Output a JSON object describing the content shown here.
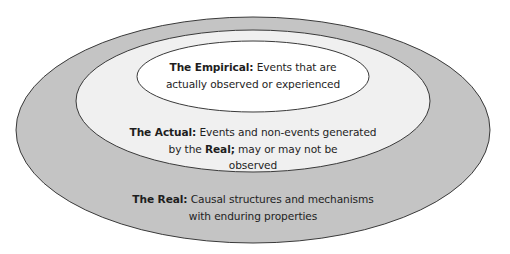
{
  "diagram": {
    "type": "nested-ellipses",
    "colors": {
      "real_fill": "#c4c4c4",
      "actual_fill": "#f0f0f0",
      "empirical_fill": "#ffffff",
      "stroke": "#3a3a3a",
      "text": "#1e1e1e"
    },
    "layers": [
      {
        "id": "real",
        "term": "The Real:",
        "line1": "Causal structures and mechanisms",
        "line2": "with enduring properties"
      },
      {
        "id": "actual",
        "term": "The Actual:",
        "line1": "Events and non-events generated",
        "line2_prefix": "by the",
        "line2_bold": "Real;",
        "line2_suffix": "may or may not be",
        "line3": "observed"
      },
      {
        "id": "empirical",
        "term": "The Empirical:",
        "line1": "Events that are",
        "line2": "actually observed or experienced"
      }
    ]
  }
}
